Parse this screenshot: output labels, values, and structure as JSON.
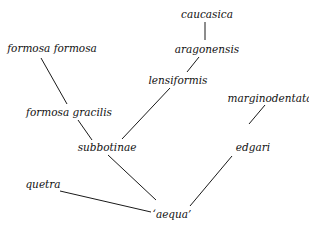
{
  "diagram": {
    "type": "tree",
    "nodes": [
      {
        "id": "caucasica",
        "label": "caucasica",
        "x": 207,
        "y": 14
      },
      {
        "id": "aragonensis",
        "label": "aragonensis",
        "x": 207,
        "y": 49
      },
      {
        "id": "lensiformis",
        "label": "lensiformis",
        "x": 178,
        "y": 80
      },
      {
        "id": "formosa_formosa",
        "label": "formosa formosa",
        "x": 52,
        "y": 48
      },
      {
        "id": "formosa_gracilis",
        "label": "formosa gracilis",
        "x": 69,
        "y": 112
      },
      {
        "id": "subbotinae",
        "label": "subbotinae",
        "x": 107,
        "y": 147
      },
      {
        "id": "marginodentata",
        "label": "marginodentata",
        "x": 270,
        "y": 98
      },
      {
        "id": "edgari",
        "label": "edgari",
        "x": 253,
        "y": 147
      },
      {
        "id": "quetra",
        "label": "quetra",
        "x": 43,
        "y": 184
      },
      {
        "id": "aequa",
        "label": "‘aequa’",
        "x": 172,
        "y": 214
      }
    ],
    "edges": [
      {
        "from": "caucasica",
        "to": "aragonensis",
        "x1": 205,
        "y1": 22,
        "x2": 205,
        "y2": 40
      },
      {
        "from": "aragonensis",
        "to": "lensiformis",
        "x1": 199,
        "y1": 57,
        "x2": 187,
        "y2": 72
      },
      {
        "from": "lensiformis",
        "to": "subbotinae",
        "x1": 170,
        "y1": 88,
        "x2": 122,
        "y2": 139
      },
      {
        "from": "formosa_formosa",
        "to": "formosa_gracilis",
        "x1": 41,
        "y1": 58,
        "x2": 67,
        "y2": 104
      },
      {
        "from": "formosa_gracilis",
        "to": "subbotinae",
        "x1": 78,
        "y1": 120,
        "x2": 92,
        "y2": 140
      },
      {
        "from": "subbotinae",
        "to": "aequa",
        "x1": 108,
        "y1": 155,
        "x2": 156,
        "y2": 200
      },
      {
        "from": "marginodentata",
        "to": "edgari",
        "x1": 265,
        "y1": 105,
        "x2": 249,
        "y2": 124
      },
      {
        "from": "edgari",
        "to": "aequa",
        "x1": 232,
        "y1": 156,
        "x2": 190,
        "y2": 206
      },
      {
        "from": "quetra",
        "to": "aequa",
        "x1": 60,
        "y1": 191,
        "x2": 151,
        "y2": 212
      }
    ]
  }
}
